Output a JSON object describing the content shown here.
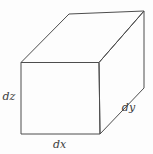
{
  "labels": {
    "dz": "dz",
    "dx": "dx",
    "dy": "dy"
  },
  "colors": {
    "line": "#4d4d4d",
    "text": "#3c3c3c",
    "background": "#fdfdfd"
  }
}
